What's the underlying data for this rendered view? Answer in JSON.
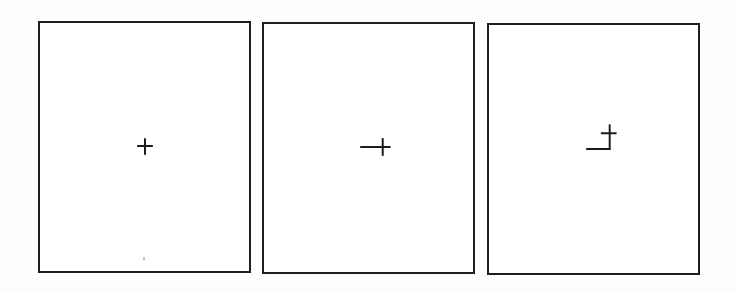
{
  "figure": {
    "panel_count": 3,
    "border_color": "#1e1e1e",
    "stroke_color": "#1a1a1a",
    "background_color": "#ffffff",
    "panels": [
      {
        "index": 1,
        "description": "Plain crosshair centered in the panel",
        "symbol": "crosshair",
        "elements": [
          {
            "type": "plus",
            "center_px": [
              145,
              146
            ],
            "half_length_px": 8
          }
        ]
      },
      {
        "index": 2,
        "description": "Crosshair with an extended left horizontal arm",
        "symbol": "crosshair-extended-left",
        "elements": [
          {
            "type": "plus",
            "center_px": [
              382,
              147
            ],
            "half_length_px": 8
          },
          {
            "type": "line",
            "from_px": [
              360,
              147
            ],
            "to_px": [
              374,
              147
            ]
          }
        ]
      },
      {
        "index": 3,
        "description": "Crosshair offset up-right with an L-shaped segment below-left",
        "symbol": "crosshair-with-L",
        "elements": [
          {
            "type": "plus",
            "center_px": [
              609,
              133
            ],
            "half_length_px": 8
          },
          {
            "type": "polyline",
            "points_px": [
              [
                587,
                149
              ],
              [
                609,
                149
              ],
              [
                609,
                133
              ]
            ]
          }
        ]
      }
    ]
  }
}
